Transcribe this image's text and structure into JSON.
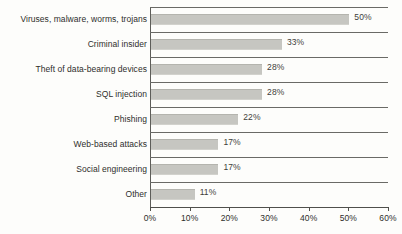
{
  "chart_data": {
    "type": "bar",
    "orientation": "horizontal",
    "title": "",
    "subtitle": "",
    "xlabel": "",
    "ylabel": "",
    "categories": [
      "Viruses, malware, worms, trojans",
      "Criminal insider",
      "Theft of data-bearing devices",
      "SQL injection",
      "Phishing",
      "Web-based attacks",
      "Social engineering",
      "Other"
    ],
    "values": [
      50,
      33,
      28,
      28,
      22,
      17,
      17,
      11
    ],
    "data_labels": [
      "50%",
      "33%",
      "28%",
      "28%",
      "22%",
      "17%",
      "17%",
      "11%"
    ],
    "xlim": [
      0,
      60
    ],
    "xticks": [
      0,
      10,
      20,
      30,
      40,
      50,
      60
    ],
    "xtick_labels": [
      "0%",
      "10%",
      "20%",
      "30%",
      "40%",
      "50%",
      "60%"
    ],
    "grid": false,
    "row_separators": true,
    "legend": null,
    "colors": {
      "bar_fill": "#c6c6c1",
      "bar_edge": "#b4b4ae",
      "axis": "#4f4f4b",
      "separator": "#6a6a66",
      "text": "#2e2e2b",
      "background": "#fdfdfb"
    }
  }
}
